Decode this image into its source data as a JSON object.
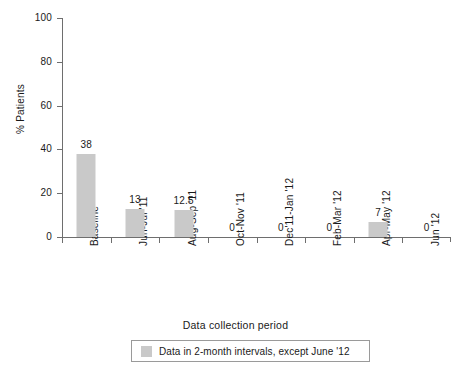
{
  "chart_data": {
    "type": "bar",
    "title": "",
    "xlabel": "Data collection period",
    "ylabel": "% Patients",
    "categories": [
      "Baseline",
      "Jun-Jul '11",
      "Aug-Sep '11",
      "Oct-Nov '11",
      "Dec'11-Jan '12",
      "Feb-Mar '12",
      "Apr-May '12",
      "Jun '12"
    ],
    "values": [
      38,
      13,
      12.5,
      0,
      0,
      0,
      7,
      0
    ],
    "value_labels": [
      "38",
      "13",
      "12.5",
      "0",
      "0",
      "0",
      "7",
      "0"
    ],
    "ylim": [
      0,
      100
    ],
    "yticks": [
      0,
      20,
      40,
      60,
      80,
      100
    ],
    "ytick_labels": [
      "0",
      "20",
      "40",
      "60",
      "80",
      "100"
    ],
    "grid": false,
    "bar_color": "#c9c9c9",
    "axis_color": "#6e6e6e",
    "text_color": "#1a1a1a",
    "legend": {
      "position": "below-axis-centered",
      "entries": [
        {
          "label": "Data in 2-month intervals, except June '12",
          "swatch_color": "#c9c9c9"
        }
      ]
    }
  }
}
